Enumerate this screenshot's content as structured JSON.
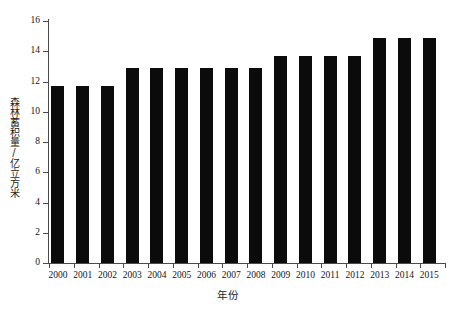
{
  "chart_data": {
    "type": "bar",
    "title": "",
    "xlabel": "年份",
    "ylabel": "森林蓄积量/亿立方米",
    "categories": [
      "2000",
      "2001",
      "2002",
      "2003",
      "2004",
      "2005",
      "2006",
      "2007",
      "2008",
      "2009",
      "2010",
      "2011",
      "2012",
      "2013",
      "2014",
      "2015"
    ],
    "values": [
      11.7,
      11.7,
      11.7,
      12.9,
      12.9,
      12.9,
      12.9,
      12.9,
      12.9,
      13.7,
      13.7,
      13.7,
      13.7,
      14.9,
      14.9,
      14.9
    ],
    "ylim": [
      0,
      16
    ],
    "yticks": [
      "0",
      "2",
      "4",
      "6",
      "8",
      "10",
      "12",
      "14",
      "16"
    ],
    "ytick_values": [
      0,
      2,
      4,
      6,
      8,
      10,
      12,
      14,
      16
    ],
    "grid": false,
    "legend": false,
    "bar_color": "#0b0b0b",
    "axis_color": "#4a4a4a"
  }
}
